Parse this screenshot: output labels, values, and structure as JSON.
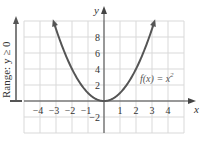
{
  "chart_data": {
    "type": "line",
    "title": "",
    "function_label": "f(x) = x",
    "function_exponent": "2",
    "xlabel": "x",
    "ylabel": "y",
    "range_label": "Range: y ≥ 0",
    "xlim": [
      -5,
      5
    ],
    "ylim": [
      -4,
      10
    ],
    "grid": true,
    "x_ticks": [
      "−4",
      "−3",
      "−2",
      "−1",
      "1",
      "2",
      "3",
      "4"
    ],
    "x_tick_values": [
      -4,
      -3,
      -2,
      -1,
      1,
      2,
      3,
      4
    ],
    "y_ticks": [
      "8",
      "6",
      "4",
      "2",
      "−2"
    ],
    "y_tick_values": [
      8,
      6,
      4,
      2,
      -2
    ],
    "series": [
      {
        "name": "f(x) = x^2",
        "x": [
          -3.2,
          -3,
          -2,
          -1,
          0,
          1,
          2,
          3,
          3.2
        ],
        "y": [
          10.24,
          9,
          4,
          1,
          0,
          1,
          4,
          9,
          10.24
        ]
      }
    ],
    "colors": {
      "curve": "#555555",
      "grid": "#d9d9d9",
      "axis": "#444444"
    }
  }
}
